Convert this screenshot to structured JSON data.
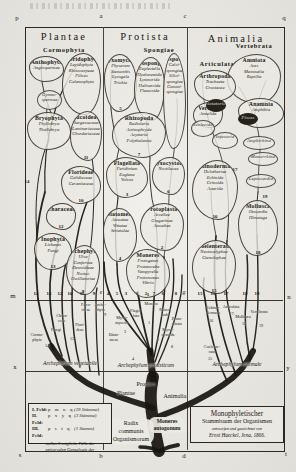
{
  "palette": {
    "paper": "#e9e7e1",
    "ink": "#1a1712",
    "frame": "#2e2a23"
  },
  "headers": [
    {
      "t": "Plantae",
      "x": 64,
      "y": 31
    },
    {
      "t": "Protista",
      "x": 145,
      "y": 31
    },
    {
      "t": "Animalia",
      "x": 236,
      "y": 33
    }
  ],
  "frame_letters": [
    {
      "t": "p",
      "x": 17,
      "y": 17
    },
    {
      "t": "a",
      "x": 101,
      "y": 15
    },
    {
      "t": "c",
      "x": 185,
      "y": 15
    },
    {
      "t": "q",
      "x": 284,
      "y": 17
    },
    {
      "t": "m",
      "x": 13,
      "y": 295
    },
    {
      "t": "n",
      "x": 289,
      "y": 296
    },
    {
      "t": "x",
      "x": 15,
      "y": 366
    },
    {
      "t": "y",
      "x": 288,
      "y": 367
    },
    {
      "t": "s",
      "x": 20,
      "y": 454
    },
    {
      "t": "b",
      "x": 101,
      "y": 455
    },
    {
      "t": "d",
      "x": 184,
      "y": 455
    },
    {
      "t": "t",
      "x": 286,
      "y": 453
    }
  ],
  "marks": [
    {
      "t": "14",
      "x": 36,
      "y": 293
    },
    {
      "t": "13",
      "x": 49,
      "y": 293
    },
    {
      "t": "12",
      "x": 60,
      "y": 293
    },
    {
      "t": "10",
      "x": 70,
      "y": 293
    },
    {
      "t": "11",
      "x": 82,
      "y": 293
    },
    {
      "t": "9",
      "x": 94,
      "y": 293
    },
    {
      "t": "e",
      "x": 101,
      "y": 292,
      "letter": true
    },
    {
      "t": "4",
      "x": 108,
      "y": 293
    },
    {
      "t": "5",
      "x": 117,
      "y": 293
    },
    {
      "t": "3",
      "x": 126,
      "y": 293
    },
    {
      "t": "1",
      "x": 137,
      "y": 293
    },
    {
      "t": "2",
      "x": 146,
      "y": 293
    },
    {
      "t": "7",
      "x": 154,
      "y": 293
    },
    {
      "t": "6",
      "x": 163,
      "y": 293
    },
    {
      "t": "8",
      "x": 176,
      "y": 293
    },
    {
      "t": "g",
      "x": 184,
      "y": 292,
      "letter": true
    },
    {
      "t": "15",
      "x": 200,
      "y": 293
    },
    {
      "t": "16",
      "x": 213,
      "y": 293
    },
    {
      "t": "17",
      "x": 226,
      "y": 293
    },
    {
      "t": "18",
      "x": 245,
      "y": 293
    },
    {
      "t": "19",
      "x": 257,
      "y": 293
    },
    {
      "t": "14",
      "x": 27,
      "y": 181
    },
    {
      "t": "17",
      "x": 235,
      "y": 169
    },
    {
      "t": "19",
      "x": 265,
      "y": 196
    }
  ],
  "stem_labels": [
    {
      "t": "Fuco-\nideae",
      "x": 86,
      "y": 303
    },
    {
      "t": "Arche-\nphyta",
      "x": 100,
      "y": 303
    },
    {
      "t": "9",
      "x": 105,
      "y": 313
    },
    {
      "t": "Chara-\nceae",
      "x": 62,
      "y": 314
    },
    {
      "t": "Fungi",
      "x": 56,
      "y": 328
    },
    {
      "t": "Flori-\ndeae",
      "x": 80,
      "y": 323
    },
    {
      "t": "13",
      "x": 72,
      "y": 337
    },
    {
      "t": "Cormo-\nphyta",
      "x": 37,
      "y": 333
    },
    {
      "t": "14",
      "x": 47,
      "y": 344
    },
    {
      "t": "Monera",
      "x": 151,
      "y": 302
    },
    {
      "t": "Flagel-\nlata",
      "x": 136,
      "y": 309
    },
    {
      "t": "Myxo-\nmycetes",
      "x": 122,
      "y": 316
    },
    {
      "t": "Rhizo-\npoda",
      "x": 165,
      "y": 308
    },
    {
      "t": "Proto-\nplasta",
      "x": 177,
      "y": 317
    },
    {
      "t": "Myxo-\ncystoda",
      "x": 168,
      "y": 328
    },
    {
      "t": "Diato-\nmeae",
      "x": 114,
      "y": 333
    },
    {
      "t": "1",
      "x": 149,
      "y": 321
    },
    {
      "t": "3",
      "x": 125,
      "y": 330
    },
    {
      "t": "2",
      "x": 158,
      "y": 338
    },
    {
      "t": "8",
      "x": 172,
      "y": 345
    },
    {
      "t": "4",
      "x": 133,
      "y": 357
    },
    {
      "t": "Echino-\ndermata",
      "x": 213,
      "y": 306
    },
    {
      "t": "16",
      "x": 211,
      "y": 319
    },
    {
      "t": "Articulata",
      "x": 231,
      "y": 305
    },
    {
      "t": "17.",
      "x": 232,
      "y": 312
    },
    {
      "t": "Mollusca",
      "x": 243,
      "y": 315
    },
    {
      "t": "18",
      "x": 244,
      "y": 322
    },
    {
      "t": "Vertebrata",
      "x": 259,
      "y": 310
    },
    {
      "t": "19",
      "x": 261,
      "y": 324
    },
    {
      "t": "Coelente-\nrata",
      "x": 212,
      "y": 345
    },
    {
      "t": "15",
      "x": 210,
      "y": 357
    }
  ],
  "groups": [
    {
      "name": "Cormophyta",
      "shape": "banner",
      "box": [
        38,
        46,
        52,
        9
      ]
    },
    {
      "name": "Anthophyta",
      "lines": [
        "Angiospermae"
      ],
      "box": [
        29,
        56,
        35,
        26
      ]
    },
    {
      "name": "Pteridophyta",
      "lines": [
        "Lepidophyta",
        "Rhizocarpeae",
        "Filices",
        "Calamophyta"
      ],
      "box": [
        62,
        53,
        39,
        62
      ],
      "alt": true
    },
    {
      "name": null,
      "shape": "oval",
      "lines": [
        "Gymno-",
        "spermae"
      ],
      "box": [
        37,
        90,
        25,
        20
      ]
    },
    {
      "name": "Bryophyta",
      "lines": [
        "Phyllobrya",
        "Thallobrya"
      ],
      "box": [
        27,
        112,
        44,
        38
      ]
    },
    {
      "name": "Fucoideae",
      "lines": [
        "Sargassaceae",
        "Laminariaceae",
        "Chordariaceae"
      ],
      "num": "11",
      "box": [
        70,
        111,
        32,
        50
      ],
      "alt": true
    },
    {
      "name": "Florideae",
      "lines": [
        "Gelidiaceae",
        "Ceramiaceae"
      ],
      "num": "10",
      "box": [
        61,
        166,
        40,
        38
      ]
    },
    {
      "name": "Characeae",
      "lines": [],
      "num": "12",
      "box": [
        46,
        203,
        30,
        27
      ],
      "alt": true
    },
    {
      "name": "Inophyta",
      "lines": [
        "Lichenes",
        "Fungi"
      ],
      "num": "13",
      "box": [
        34,
        233,
        38,
        37
      ]
    },
    {
      "name": "Archephyta",
      "lines": [
        "Ulva",
        "Confervae",
        "Desmidieae",
        "Nostoc",
        "Oscillatoriae"
      ],
      "num": "9",
      "box": [
        66,
        245,
        34,
        50
      ],
      "alt": true
    },
    {
      "name": "Spongiae",
      "shape": "banner",
      "box": [
        136,
        46,
        46,
        9
      ]
    },
    {
      "name": "Myxomycetes",
      "lines": [
        "Physarum",
        "Stemonitis",
        "Lycogala",
        "Trichia"
      ],
      "num": "5",
      "box": [
        104,
        54,
        33,
        58
      ]
    },
    {
      "name": "Petrospongiae",
      "lines": [
        "Euplectella",
        "Hyalonemida",
        "Lymnorida",
        "Halisarcida",
        "Plumosida"
      ],
      "box": [
        134,
        57,
        31,
        64
      ],
      "alt": true
    },
    {
      "name": "Autospongiae",
      "lines": [
        "Calci-",
        "spongiae",
        "Silici-",
        "spongiae",
        "Gummi-",
        "spongiae"
      ],
      "box": [
        163,
        53,
        23,
        96
      ]
    },
    {
      "name": "Rhizopoda",
      "lines": [
        "Radiolaria",
        "Actinophryda",
        "Acyttaria",
        "Polythalamia"
      ],
      "num": "7",
      "box": [
        112,
        112,
        54,
        46
      ],
      "alt": true
    },
    {
      "name": "Flagellata",
      "lines": [
        "Peridinium",
        "Euglena",
        "Volvox"
      ],
      "num": "3",
      "box": [
        106,
        157,
        42,
        41
      ]
    },
    {
      "name": "Myxocystoda",
      "lines": [
        "Noctilucae"
      ],
      "num": "6",
      "box": [
        152,
        157,
        33,
        38
      ],
      "alt": true
    },
    {
      "name": "Diatomeae",
      "lines": [
        "Arcuatae",
        "Vittatae",
        "Striatulae"
      ],
      "num": "4",
      "box": [
        103,
        208,
        34,
        54
      ]
    },
    {
      "name": "Protoplasta",
      "lines": [
        "Arcellae",
        "Gregarinae",
        "Amoebae"
      ],
      "num": "2",
      "box": [
        140,
        203,
        44,
        48
      ],
      "alt": true
    },
    {
      "name": "Moneres",
      "lines": [
        "Protogenes",
        "Protamoeba",
        "Vampyrella",
        "Protomonas",
        "Vibrio"
      ],
      "num": "1",
      "box": [
        126,
        249,
        44,
        49
      ]
    },
    {
      "name": "Vertebrata",
      "shape": "banner",
      "box": [
        226,
        42,
        56,
        9
      ]
    },
    {
      "name": "Articulata",
      "shape": "banner",
      "box": [
        194,
        60,
        46,
        9
      ]
    },
    {
      "name": "Amniota",
      "lines": [
        "Aves",
        "Mammalia",
        "Reptilia"
      ],
      "box": [
        227,
        54,
        54,
        50
      ],
      "alt": true
    },
    {
      "name": "Arthropoda",
      "lines": [
        "Tracheata",
        "Crustacea"
      ],
      "box": [
        194,
        70,
        42,
        32
      ]
    },
    {
      "name": "Vermes",
      "lines": [
        "Annelida"
      ],
      "box": [
        193,
        102,
        30,
        26
      ],
      "alt": true
    },
    {
      "name": "Rotatoria",
      "shape": "oval-dark",
      "box": [
        206,
        99,
        20,
        13
      ]
    },
    {
      "name": "Scolecida",
      "shape": "oval",
      "box": [
        191,
        120,
        24,
        17
      ]
    },
    {
      "name": "Infusoria",
      "shape": "oval",
      "box": [
        212,
        132,
        26,
        17
      ]
    },
    {
      "name": "Anamnia",
      "lines": [
        "Amphibia"
      ],
      "box": [
        238,
        98,
        46,
        30
      ]
    },
    {
      "name": "Pisces",
      "shape": "oval-dark",
      "box": [
        238,
        113,
        20,
        12
      ]
    },
    {
      "name": "Amphirhina",
      "shape": "oval",
      "box": [
        243,
        136,
        32,
        14
      ]
    },
    {
      "name": "Monorrhina",
      "shape": "oval",
      "box": [
        248,
        152,
        30,
        14
      ]
    },
    {
      "name": "Leptocardia",
      "shape": "oval",
      "box": [
        246,
        174,
        30,
        14
      ]
    },
    {
      "name": "Echinodermata",
      "lines": [
        "Holothuriae",
        "Echinida",
        "Crinoida",
        "Asterida"
      ],
      "num": "16",
      "box": [
        192,
        160,
        46,
        60
      ],
      "alt": true
    },
    {
      "name": "Mollusca",
      "lines": [
        "Otocardia",
        "Himatega"
      ],
      "num": "18",
      "box": [
        238,
        200,
        40,
        56
      ]
    },
    {
      "name": "Coelenterata",
      "lines": [
        "Nectocalyphae",
        "Ctenolophae"
      ],
      "num": "15",
      "box": [
        192,
        240,
        44,
        54
      ],
      "alt": true
    }
  ],
  "arche_labels": [
    {
      "t": "Archephylum vegetabile",
      "x": 70,
      "y": 360
    },
    {
      "t": "Archephylum protisticum",
      "x": 146,
      "y": 362
    },
    {
      "t": "Archephylum animale",
      "x": 237,
      "y": 361
    }
  ],
  "trunk_labels": [
    {
      "t": "Plantae",
      "x": 126,
      "y": 389
    },
    {
      "t": "Protista",
      "x": 146,
      "y": 380
    },
    {
      "t": "Animalia",
      "x": 175,
      "y": 392
    }
  ],
  "radix": {
    "lines": "Radix\ncommunis\nOrganismorum"
  },
  "moneres": {
    "lines": "Moneres\nautogonum"
  },
  "legend": {
    "rows": [
      {
        "f": "I. Feld:",
        "k": "p m n q",
        "c": "(19 Stämme)"
      },
      {
        "f": "II. Feld:",
        "k": "p x y q",
        "c": "(3 Stämme)"
      },
      {
        "f": "III. Feld:",
        "k": "p s t q",
        "c": "(1 Stamm)"
      }
    ],
    "note": "stellen 3 mögliche Fälle der\nuniversalen Genealogie dar"
  },
  "title_box": {
    "l1": "Monophyletischer",
    "l2": "Stammbaum der Organismen",
    "l3": "entworfen und gezeichnet von",
    "l4": "Ernst Haeckel, Jena, 1866."
  }
}
